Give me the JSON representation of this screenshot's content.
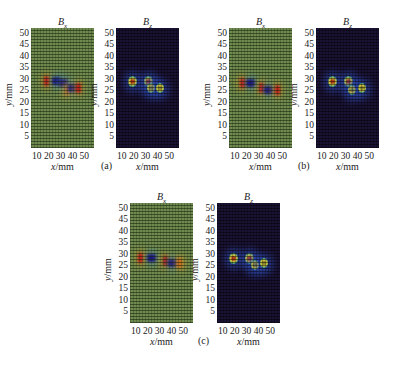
{
  "chart_data": [
    {
      "type": "heatmap",
      "subfigure": "(a)",
      "panels": [
        {
          "title": "Bx",
          "colormap": "jet-centered-green",
          "xlabel": "x/mm",
          "ylabel": "y/mm",
          "xticks": [
            10,
            20,
            30,
            40,
            50
          ],
          "yticks": [
            5,
            10,
            15,
            20,
            25,
            30,
            35,
            40,
            45,
            50
          ],
          "xlim": [
            0,
            52
          ],
          "ylim": [
            0,
            52
          ],
          "features": [
            {
              "x": 13,
              "y": 29,
              "sign": "positive",
              "color": "#c41a1a"
            },
            {
              "x": 21,
              "y": 29,
              "sign": "negative",
              "color": "#1c1a8a"
            },
            {
              "x": 27,
              "y": 28,
              "sign": "negative",
              "color": "#1c1a8a"
            },
            {
              "x": 30,
              "y": 25,
              "sign": "positive",
              "color": "#d56c1a"
            },
            {
              "x": 34,
              "y": 26,
              "sign": "negative",
              "color": "#1c1a8a"
            },
            {
              "x": 39,
              "y": 26,
              "sign": "positive",
              "color": "#c41a1a"
            }
          ]
        },
        {
          "title": "Bz",
          "colormap": "jet-dark",
          "xlabel": "x/mm",
          "ylabel": "y/mm",
          "xticks": [
            10,
            20,
            30,
            40,
            50
          ],
          "yticks": [
            5,
            10,
            15,
            20,
            25,
            30,
            35,
            40,
            45,
            50
          ],
          "xlim": [
            0,
            52
          ],
          "ylim": [
            0,
            52
          ],
          "features": [
            {
              "x": 14,
              "y": 29,
              "intensity": "high"
            },
            {
              "x": 27,
              "y": 29,
              "intensity": "high"
            },
            {
              "x": 29,
              "y": 26,
              "intensity": "medium"
            },
            {
              "x": 36,
              "y": 26,
              "intensity": "medium"
            }
          ]
        }
      ]
    },
    {
      "type": "heatmap",
      "subfigure": "(b)",
      "panels": [
        {
          "title": "Bx",
          "colormap": "jet-centered-green",
          "xlabel": "x/mm",
          "ylabel": "y/mm",
          "xticks": [
            10,
            20,
            30,
            40,
            50
          ],
          "yticks": [
            5,
            10,
            15,
            20,
            25,
            30,
            35,
            40,
            45,
            50
          ],
          "xlim": [
            0,
            52
          ],
          "ylim": [
            0,
            52
          ],
          "features": [
            {
              "x": 11,
              "y": 28,
              "sign": "positive",
              "color": "#c41a1a"
            },
            {
              "x": 18,
              "y": 28,
              "sign": "negative",
              "color": "#1c1a8a"
            },
            {
              "x": 27,
              "y": 26,
              "sign": "positive",
              "color": "#c41a1a"
            },
            {
              "x": 33,
              "y": 25,
              "sign": "negative",
              "color": "#1c1a8a"
            },
            {
              "x": 40,
              "y": 25,
              "sign": "positive",
              "color": "#c41a1a"
            }
          ]
        },
        {
          "title": "Bz",
          "colormap": "jet-dark",
          "xlabel": "x/mm",
          "ylabel": "y/mm",
          "xticks": [
            10,
            20,
            30,
            40,
            50
          ],
          "yticks": [
            5,
            10,
            15,
            20,
            25,
            30,
            35,
            40,
            45,
            50
          ],
          "xlim": [
            0,
            52
          ],
          "ylim": [
            0,
            52
          ],
          "features": [
            {
              "x": 14,
              "y": 29,
              "intensity": "high"
            },
            {
              "x": 27,
              "y": 29,
              "intensity": "high"
            },
            {
              "x": 30,
              "y": 25,
              "intensity": "medium"
            },
            {
              "x": 38,
              "y": 26,
              "intensity": "medium"
            }
          ]
        }
      ]
    },
    {
      "type": "heatmap",
      "subfigure": "(c)",
      "panels": [
        {
          "title": "Bx",
          "colormap": "jet-centered-green",
          "xlabel": "x/mm",
          "ylabel": "y/mm",
          "xticks": [
            10,
            20,
            30,
            40,
            50
          ],
          "yticks": [
            5,
            10,
            15,
            20,
            25,
            30,
            35,
            40,
            45,
            50
          ],
          "xlim": [
            0,
            52
          ],
          "ylim": [
            0,
            52
          ],
          "features": [
            {
              "x": 9,
              "y": 28,
              "sign": "positive",
              "color": "#c41a1a"
            },
            {
              "x": 18,
              "y": 28,
              "sign": "negative",
              "color": "#1c1a8a"
            },
            {
              "x": 29,
              "y": 27,
              "sign": "positive",
              "color": "#b01515"
            },
            {
              "x": 35,
              "y": 26,
              "sign": "negative",
              "color": "#1c1a8a"
            },
            {
              "x": 41,
              "y": 26,
              "sign": "positive",
              "color": "#d56c1a"
            }
          ]
        },
        {
          "title": "Bz",
          "colormap": "jet-dark",
          "xlabel": "x/mm",
          "ylabel": "y/mm",
          "xticks": [
            10,
            20,
            30,
            40,
            50
          ],
          "yticks": [
            5,
            10,
            15,
            20,
            25,
            30,
            35,
            40,
            45,
            50
          ],
          "xlim": [
            0,
            52
          ],
          "ylim": [
            0,
            52
          ],
          "features": [
            {
              "x": 14,
              "y": 28,
              "intensity": "high"
            },
            {
              "x": 27,
              "y": 28,
              "intensity": "high"
            },
            {
              "x": 31,
              "y": 25,
              "intensity": "medium"
            },
            {
              "x": 39,
              "y": 26,
              "intensity": "medium"
            }
          ]
        }
      ]
    }
  ],
  "labels": {
    "bx_title": "B",
    "bx_sub": "x",
    "bz_title": "B",
    "bz_sub": "z",
    "ylabel_var": "y",
    "ylabel_unit": "/mm",
    "xlabel_var": "x",
    "xlabel_unit": "/mm",
    "xticks_text": "10 20 30 40 50",
    "yticks": [
      "50",
      "45",
      "40",
      "35",
      "30",
      "25",
      "20",
      "15",
      "10",
      "5"
    ],
    "captions": [
      "(a)",
      "(b)",
      "(c)"
    ]
  },
  "colors": {
    "bx_background": "#6f8a4e",
    "bz_background": "#1a1233",
    "positive": "#c41a1a",
    "negative": "#1c1a8a",
    "bz_peak": "#d4c33a"
  }
}
